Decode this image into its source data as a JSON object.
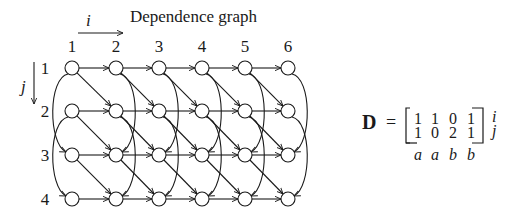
{
  "title": "Dependence graph",
  "axes": {
    "i_label": "i",
    "j_label": "j"
  },
  "columns": [
    "1",
    "2",
    "3",
    "4",
    "5",
    "6"
  ],
  "rows": [
    "1",
    "2",
    "3",
    "4"
  ],
  "graph": {
    "node_shape": "circle",
    "edges": {
      "horizontal": "(i,j) -> (i+1,j)",
      "diagonal": "(i,j) -> (i+1,j+1)",
      "vertical_skip": "(i,j) -> (i,j+2)"
    }
  },
  "matrix": {
    "name": "D",
    "equals": "=",
    "rows": [
      [
        "1",
        "1",
        "0",
        "1"
      ],
      [
        "1",
        "0",
        "2",
        "1"
      ]
    ],
    "row_labels": [
      "i",
      "j"
    ],
    "column_labels": [
      "a",
      "a",
      "b",
      "b"
    ]
  }
}
